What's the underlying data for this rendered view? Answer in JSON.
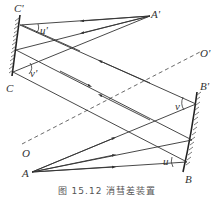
{
  "figure": {
    "caption": "图 15.12  消彗差装置",
    "labels": {
      "C_prime": "C'",
      "C": "C",
      "A_prime": "A'",
      "A": "A",
      "B_prime": "B'",
      "B": "B",
      "O": "O",
      "O_prime": "O'",
      "u_prime": "u'",
      "v_prime": "v'",
      "u": "u",
      "v": "v"
    },
    "colors": {
      "line": "#333333",
      "background": "#ffffff"
    }
  }
}
